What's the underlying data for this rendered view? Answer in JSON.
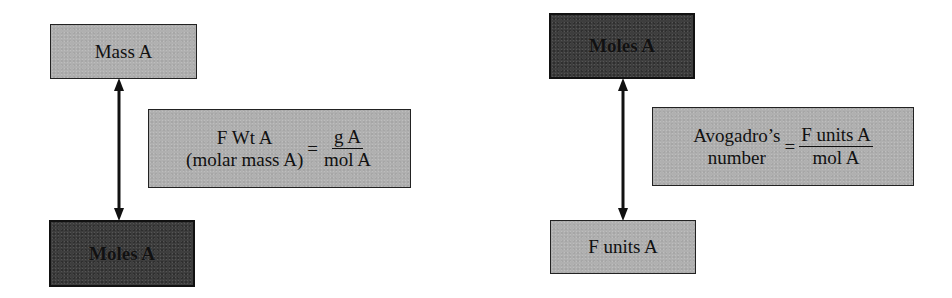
{
  "left_diagram": {
    "top_box": {
      "label": "Mass A",
      "shade": "light"
    },
    "bottom_box": {
      "label": "Moles A",
      "shade": "dark"
    },
    "connector": "double-headed-arrow",
    "formula": {
      "lhs_line1": "F Wt A",
      "lhs_line2": "(molar mass A)",
      "equals": "=",
      "numerator": "g A",
      "denominator": "mol A"
    }
  },
  "right_diagram": {
    "top_box": {
      "label": "Moles A",
      "shade": "dark"
    },
    "bottom_box": {
      "label": "F units A",
      "shade": "light"
    },
    "connector": "double-headed-arrow",
    "formula": {
      "lhs_line1": "Avogadro’s",
      "lhs_line2": "number",
      "equals": "=",
      "numerator": "F units A",
      "denominator": "mol A"
    }
  },
  "colors": {
    "light_box": "#b0b0b0",
    "dark_box": "#3e3e3e",
    "border": "#222222",
    "arrow": "#111111"
  }
}
